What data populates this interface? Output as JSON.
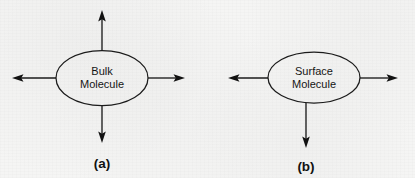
{
  "figure": {
    "background_color": "#f5f5f4",
    "stroke_color": "#1b1b1b",
    "text_color": "#151515",
    "panels": [
      {
        "id": "a",
        "caption": "(a)",
        "label_line_1": "Bulk",
        "label_line_2": "Molecule",
        "arrow_count": 4,
        "arrow_directions": [
          "up",
          "right",
          "down",
          "left"
        ]
      },
      {
        "id": "b",
        "caption": "(b)",
        "label_line_1": "Surface",
        "label_line_2": "Molecule",
        "arrow_count": 3,
        "arrow_directions": [
          "right",
          "down",
          "left"
        ]
      }
    ]
  }
}
